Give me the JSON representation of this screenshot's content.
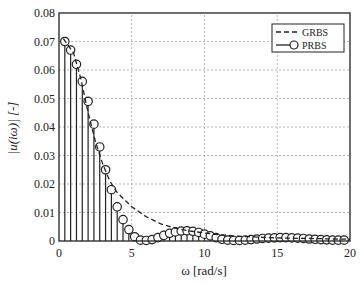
{
  "chart_data": {
    "type": "line",
    "title": "",
    "xlabel": "ω [rad/s]",
    "ylabel": "|u(iω)| [-]",
    "xlim": [
      0,
      20
    ],
    "ylim": [
      0,
      0.08
    ],
    "xticks": [
      "0",
      "5",
      "10",
      "15",
      "20"
    ],
    "yticks": [
      "0",
      "0.01",
      "0.02",
      "0.03",
      "0.04",
      "0.05",
      "0.06",
      "0.07",
      "0.08"
    ],
    "grid": true,
    "legend_position": "upper right",
    "series": [
      {
        "name": "GRBS",
        "style": "dashed",
        "x": [
          0.3,
          1,
          1.5,
          2,
          2.5,
          3,
          3.5,
          4,
          5,
          6,
          7,
          8,
          9,
          10,
          11,
          12,
          13,
          14,
          15,
          16,
          17,
          18,
          19,
          20
        ],
        "values": [
          0.071,
          0.066,
          0.057,
          0.045,
          0.035,
          0.027,
          0.021,
          0.017,
          0.012,
          0.0085,
          0.006,
          0.0045,
          0.0035,
          0.0028,
          0.0022,
          0.0018,
          0.0015,
          0.0013,
          0.0011,
          0.001,
          0.0009,
          0.0008,
          0.0007,
          0.0006
        ]
      },
      {
        "name": "PRBS",
        "style": "stem-circle",
        "x": [
          0.4,
          0.8,
          1.2,
          1.6,
          2.0,
          2.4,
          2.8,
          3.2,
          3.6,
          4.0,
          4.4,
          4.8,
          5.2,
          5.6,
          6.0,
          6.4,
          6.8,
          7.2,
          7.6,
          8.0,
          8.4,
          8.8,
          9.2,
          9.6,
          10.0,
          10.4,
          10.8,
          11.2,
          11.6,
          12.0,
          12.4,
          12.8,
          13.2,
          13.6,
          14.0,
          14.4,
          14.8,
          15.2,
          15.6,
          16.0,
          16.4,
          16.8,
          17.2,
          17.6,
          18.0,
          18.4,
          18.8,
          19.2,
          19.6
        ],
        "values": [
          0.07,
          0.067,
          0.062,
          0.056,
          0.049,
          0.041,
          0.033,
          0.025,
          0.018,
          0.012,
          0.0075,
          0.004,
          0.0015,
          0.0003,
          0.0002,
          0.0005,
          0.0012,
          0.002,
          0.0027,
          0.0032,
          0.0035,
          0.0036,
          0.0034,
          0.003,
          0.0024,
          0.0018,
          0.0012,
          0.0006,
          0.0003,
          0.0002,
          0.0002,
          0.0003,
          0.0005,
          0.0007,
          0.0009,
          0.001,
          0.0011,
          0.0012,
          0.0012,
          0.0011,
          0.001,
          0.0009,
          0.0007,
          0.0006,
          0.0005,
          0.0004,
          0.0003,
          0.0003,
          0.0003
        ]
      }
    ]
  },
  "legend": {
    "items": [
      "GRBS",
      "PRBS"
    ]
  }
}
